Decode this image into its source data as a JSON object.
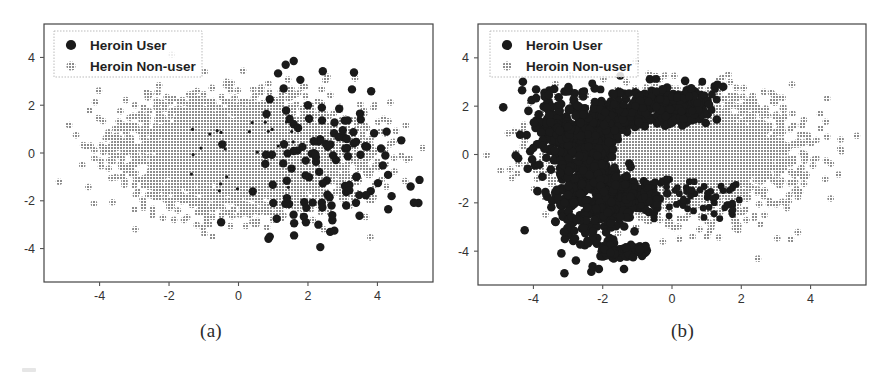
{
  "figure": {
    "background_color": "#ffffff",
    "panels": [
      {
        "id": "a",
        "caption": "(a)",
        "frame": {
          "x": 44,
          "y": 24,
          "width": 389,
          "height": 258
        }
      },
      {
        "id": "b",
        "caption": "(b)",
        "frame": {
          "x": 32,
          "y": 24,
          "width": 388,
          "height": 261
        }
      }
    ]
  },
  "colors": {
    "heroin_user": "#1a1a1a",
    "heroin_non_user": "#8c8c8c",
    "axis": "#555555",
    "tick_label": "#333333",
    "legend_border": "#bbbbbb",
    "frame": "#444444"
  },
  "legend": {
    "position": "upper left",
    "border_color": "#bbbbbb",
    "entries": [
      {
        "label": "Heroin User",
        "marker": "filled-circle",
        "color": "#1a1a1a"
      },
      {
        "label": "Heroin Non-user",
        "marker": "dotted-circle",
        "color": "#8c8c8c"
      }
    ]
  },
  "chart_data": [
    {
      "type": "scatter",
      "panel": "a",
      "title": "",
      "xlabel": "",
      "ylabel": "",
      "xlim": [
        -5.6,
        5.6
      ],
      "ylim": [
        -5.4,
        5.4
      ],
      "xticks": [
        -4,
        -2,
        0,
        2,
        4
      ],
      "yticks": [
        -4,
        -2,
        0,
        2,
        4
      ],
      "xticklabels": [
        "-4",
        "-2",
        "0",
        "2",
        "4"
      ],
      "yticklabels": [
        "-4",
        "-2",
        "0",
        "2",
        "4"
      ],
      "grid": false,
      "legend": [
        "Heroin User",
        "Heroin Non-user"
      ],
      "series": [
        {
          "name": "Heroin Non-user",
          "color": "#8c8c8c",
          "marker": "dotted-circle",
          "n_points": 3400,
          "distribution": "gaussian-ellipse",
          "center": [
            0.05,
            0.0
          ],
          "sigma": [
            1.62,
            1.12
          ],
          "rotation_deg": 0
        },
        {
          "name": "Heroin User",
          "color": "#1a1a1a",
          "marker": "filled-circle",
          "n_points": 115,
          "distribution": "gaussian-ellipse-right-shifted",
          "center": [
            2.35,
            -0.15
          ],
          "sigma": [
            1.15,
            1.55
          ],
          "rotation_deg": 0
        }
      ]
    },
    {
      "type": "scatter",
      "panel": "b",
      "title": "",
      "xlabel": "",
      "ylabel": "",
      "xlim": [
        -5.6,
        5.6
      ],
      "ylim": [
        -5.4,
        5.4
      ],
      "xticks": [
        -4,
        -2,
        0,
        2,
        4
      ],
      "yticks": [
        -4,
        -2,
        0,
        2,
        4
      ],
      "xticklabels": [
        "-4",
        "-2",
        "0",
        "2",
        "4"
      ],
      "yticklabels": [
        "-4",
        "-2",
        "0",
        "2",
        "4"
      ],
      "grid": false,
      "legend": [
        "Heroin User",
        "Heroin Non-user"
      ],
      "series": [
        {
          "name": "Heroin Non-user",
          "color": "#8c8c8c",
          "marker": "dotted-circle",
          "n_points": 3400,
          "distribution": "gaussian-ellipse",
          "center": [
            0.1,
            0.0
          ],
          "sigma": [
            1.62,
            1.12
          ],
          "rotation_deg": 0
        },
        {
          "name": "Heroin User",
          "color": "#1a1a1a",
          "marker": "filled-circle",
          "n_points": 900,
          "distribution": "left-crescent-arc",
          "center": [
            -2.15,
            -0.45
          ],
          "sigma": [
            1.05,
            1.55
          ],
          "rotation_deg": 0
        }
      ]
    }
  ]
}
